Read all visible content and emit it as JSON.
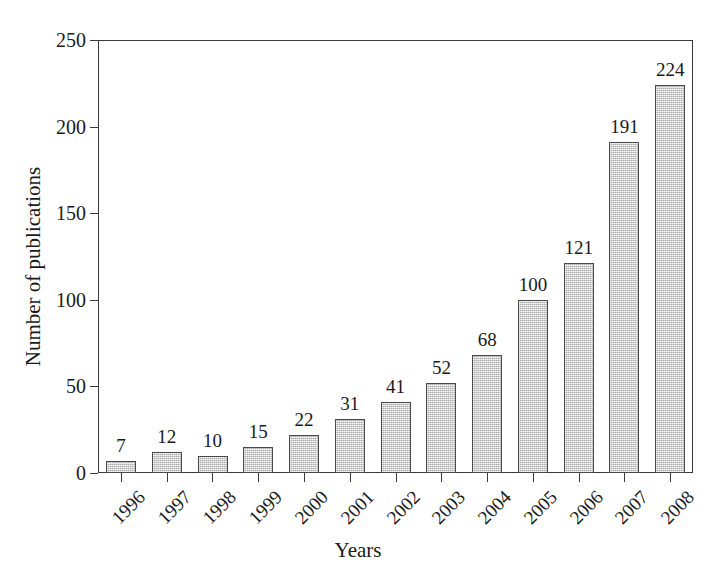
{
  "chart_data": {
    "type": "bar",
    "title": "",
    "subtitle": "",
    "xlabel": "Years",
    "ylabel": "Number of publications",
    "categories": [
      "1996",
      "1997",
      "1998",
      "1999",
      "2000",
      "2001",
      "2002",
      "2003",
      "2004",
      "2005",
      "2006",
      "2007",
      "2008"
    ],
    "values": [
      7,
      12,
      10,
      15,
      22,
      31,
      41,
      52,
      68,
      100,
      121,
      191,
      224
    ],
    "data_labels": [
      "7",
      "12",
      "10",
      "15",
      "22",
      "31",
      "41",
      "52",
      "68",
      "100",
      "121",
      "191",
      "224"
    ],
    "ylim": [
      0,
      250
    ],
    "yticks": [
      0,
      50,
      100,
      150,
      200,
      250
    ],
    "ytick_labels": [
      "0",
      "50",
      "100",
      "150",
      "200",
      "250"
    ],
    "grid": false,
    "legend": false,
    "legend_position": "none",
    "series": [
      {
        "name": "Number of publications",
        "values": [
          7,
          12,
          10,
          15,
          22,
          31,
          41,
          52,
          68,
          100,
          121,
          191,
          224
        ]
      }
    ],
    "xtick_label_rotation": -45,
    "bar_fill_color": "#cfcfcf",
    "bar_edge_color": "#4a4a4a",
    "axis_color": "#3a3a3a",
    "background_color": "#ffffff",
    "text_color": "#1a1a1a"
  }
}
